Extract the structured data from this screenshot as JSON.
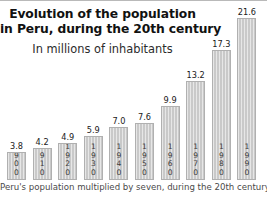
{
  "chart_data": {
    "type": "bar",
    "title": "Evolution of the population in Peru, during the 20th century",
    "title_line1": "Evolution of the population",
    "title_line2": "in Peru, during the 20th century",
    "subtitle": "In millions of inhabitants",
    "caption": "Peru's population multiplied by seven, during the 20th century",
    "xlabel": "",
    "ylabel": "In millions of inhabitants",
    "ylim": [
      0,
      21.6
    ],
    "grid": false,
    "legend": false,
    "bar_color": "#c9c9c9",
    "categories": [
      "1900",
      "1910",
      "1920",
      "1930",
      "1940",
      "1950",
      "1960",
      "1970",
      "1980",
      "1990"
    ],
    "values": [
      3.8,
      4.2,
      4.9,
      5.9,
      7.0,
      7.6,
      9.9,
      13.2,
      17.3,
      21.6
    ],
    "value_labels": [
      "3.8",
      "4.2",
      "4.9",
      "5.9",
      "7.0",
      "7.6",
      "9.9",
      "13.2",
      "17.3",
      "21.6"
    ],
    "bars": [
      {
        "year": "1900",
        "year_digits": [
          "1",
          "9",
          "0",
          "0"
        ],
        "value": 3.8,
        "label": "3.8"
      },
      {
        "year": "1910",
        "year_digits": [
          "1",
          "9",
          "1",
          "0"
        ],
        "value": 4.2,
        "label": "4.2"
      },
      {
        "year": "1920",
        "year_digits": [
          "1",
          "9",
          "2",
          "0"
        ],
        "value": 4.9,
        "label": "4.9"
      },
      {
        "year": "1930",
        "year_digits": [
          "1",
          "9",
          "3",
          "0"
        ],
        "value": 5.9,
        "label": "5.9"
      },
      {
        "year": "1940",
        "year_digits": [
          "1",
          "9",
          "4",
          "0"
        ],
        "value": 7.0,
        "label": "7.0"
      },
      {
        "year": "1950",
        "year_digits": [
          "1",
          "9",
          "5",
          "0"
        ],
        "value": 7.6,
        "label": "7.6"
      },
      {
        "year": "1960",
        "year_digits": [
          "1",
          "9",
          "6",
          "0"
        ],
        "value": 9.9,
        "label": "9.9"
      },
      {
        "year": "1970",
        "year_digits": [
          "1",
          "9",
          "7",
          "0"
        ],
        "value": 13.2,
        "label": "13.2"
      },
      {
        "year": "1980",
        "year_digits": [
          "1",
          "9",
          "8",
          "0"
        ],
        "value": 17.3,
        "label": "17.3"
      },
      {
        "year": "1990",
        "year_digits": [
          "1",
          "9",
          "9",
          "0"
        ],
        "value": 21.6,
        "label": "21.6"
      }
    ]
  }
}
